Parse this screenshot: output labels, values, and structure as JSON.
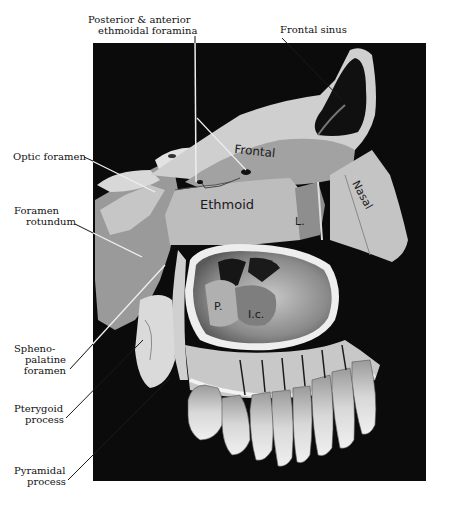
{
  "figure": {
    "type": "anatomical-photograph",
    "colors": {
      "background": "#ffffff",
      "photo_panel": "#0a0a0a",
      "bone_light": "#dcdcdc",
      "bone_mid": "#a8a8a8",
      "bone_dark": "#6e6e6e",
      "label_text": "#111111",
      "leader_line": "#1a1a1a"
    }
  },
  "external_labels": {
    "posterior_anterior_ethmoidal": {
      "line1": "Posterior  & anterior",
      "line2": "ethmoidal foramina"
    },
    "frontal_sinus": {
      "line1": "Frontal sinus"
    },
    "optic_foramen": {
      "line1": "Optic foramen"
    },
    "foramen_rotundum": {
      "line1": "Foramen",
      "line2": "rotundum"
    },
    "sphenopalatine_foramen": {
      "line1": "Spheno-",
      "line2": "palatine",
      "line3": "foramen"
    },
    "pterygoid_process": {
      "line1": "Pterygoid",
      "line2": "process"
    },
    "pyramidal_process": {
      "line1": "Pyramidal",
      "line2": "process"
    }
  },
  "internal_labels": {
    "frontal": "Frontal",
    "ethmoid": "Ethmoid",
    "lacrimal": "L.",
    "nasal": "Nasal",
    "palatine": "P.",
    "inferior_concha": "I.c."
  }
}
